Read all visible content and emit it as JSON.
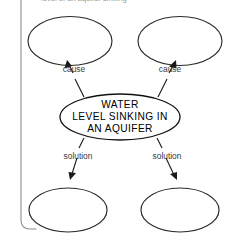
{
  "diagram": {
    "type": "cause-and-solution-web",
    "heading_partial": "level of an aquifer sinking",
    "center_node": {
      "name": "central-topic",
      "lines": [
        "WATER",
        "LEVEL SINKING IN",
        "AN AQUIFER"
      ],
      "text": "WATER LEVEL SINKING IN AN AQUIFER"
    },
    "edges": [
      {
        "label": "cause",
        "direction": "up",
        "side": "left"
      },
      {
        "label": "cause",
        "direction": "up",
        "side": "right"
      },
      {
        "label": "solution",
        "direction": "down",
        "side": "left"
      },
      {
        "label": "solution",
        "direction": "down",
        "side": "right"
      }
    ],
    "outer_nodes": [
      {
        "name": "cause-oval-top-left",
        "text": "",
        "position": "top-left"
      },
      {
        "name": "cause-oval-top-right",
        "text": "",
        "position": "top-right"
      },
      {
        "name": "solution-oval-bottom-left",
        "text": "",
        "position": "bottom-left"
      },
      {
        "name": "solution-oval-bottom-right",
        "text": "",
        "position": "bottom-right"
      }
    ],
    "colors": {
      "stroke": "#1a1a1a",
      "oval_stroke": "#2b2b2b",
      "bracket": "#8d8d8d",
      "background": "#ffffff",
      "label_text": "#3a3a3a"
    }
  }
}
